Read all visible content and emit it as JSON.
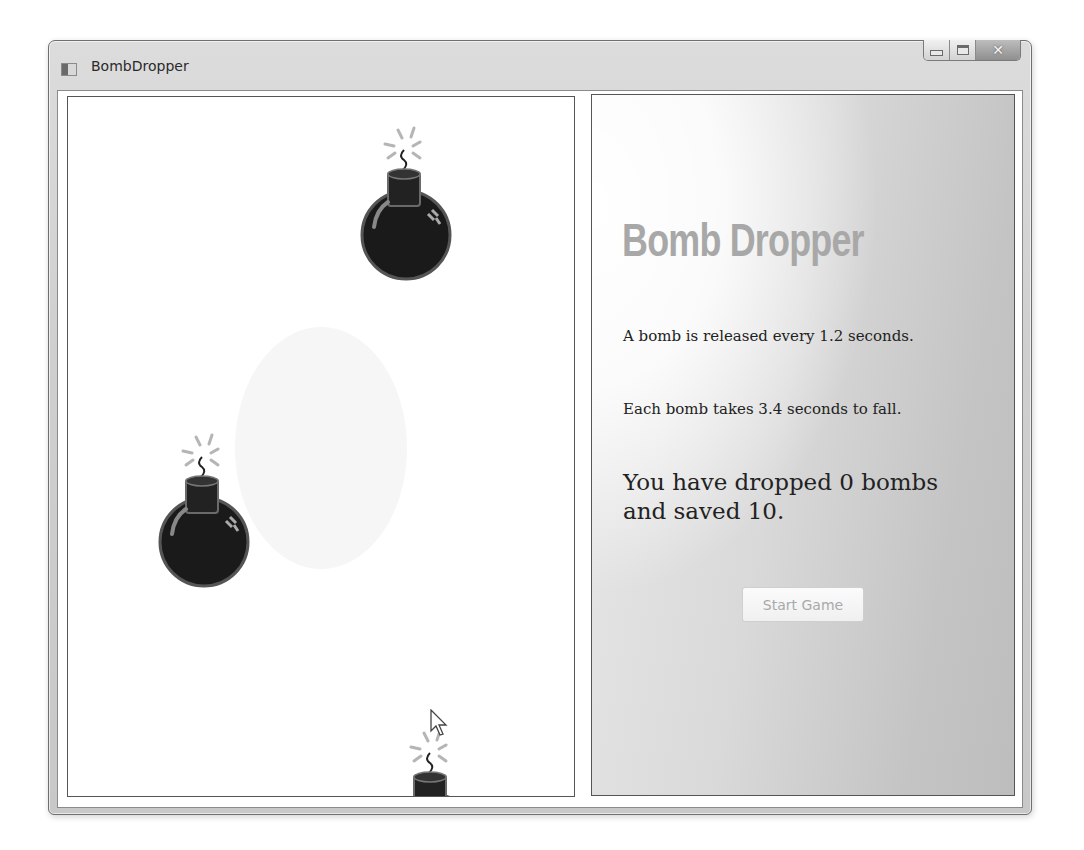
{
  "window": {
    "title": "BombDropper",
    "controls": {
      "minimize": "minimize",
      "maximize": "maximize",
      "close": "close"
    }
  },
  "game_canvas": {
    "bombs": [
      {
        "id": 1,
        "x": 290,
        "y": 25,
        "state": "falling"
      },
      {
        "id": 2,
        "x": 88,
        "y": 332,
        "state": "falling"
      },
      {
        "id": 3,
        "x": 330,
        "y": 630,
        "state": "falling",
        "partially_visible": true
      }
    ]
  },
  "info_panel": {
    "title": "Bomb Dropper",
    "release_text": "A bomb is released every 1.2 seconds.",
    "fall_text": "Each bomb takes 3.4 seconds to fall.",
    "score_text": "You have dropped 0 bombs and saved 10.",
    "dropped": 0,
    "saved": 10,
    "release_interval_seconds": 1.2,
    "fall_duration_seconds": 3.4,
    "start_button_label": "Start Game",
    "start_button_enabled": false
  },
  "colors": {
    "title_gray": "#a8a8a8",
    "text": "#222222",
    "bomb_body": "#111111",
    "disabled_text": "#a9a9a9"
  }
}
